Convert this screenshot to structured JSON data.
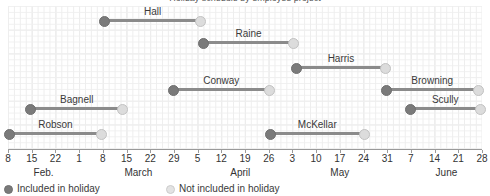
{
  "chart": {
    "title": "Holiday schedule by employee project",
    "title_clipped": true
  },
  "chart_data": {
    "type": "bar",
    "subtype": "gantt",
    "title": "Holiday schedule by employee project",
    "xlabel": "",
    "ylabel": "",
    "grid": true,
    "legend_position": "bottom-left",
    "x_unit": "week",
    "x_tick_labels": [
      "8",
      "15",
      "22",
      "1",
      "8",
      "15",
      "22",
      "29",
      "5",
      "12",
      "19",
      "26",
      "3",
      "10",
      "17",
      "24",
      "31",
      "7",
      "14",
      "21",
      "28"
    ],
    "x_tick_weeks": [
      0,
      1,
      2,
      3,
      4,
      5,
      6,
      7,
      8,
      9,
      10,
      11,
      12,
      13,
      14,
      15,
      16,
      17,
      18,
      19,
      20
    ],
    "month_labels": [
      {
        "label": "Feb.",
        "week": 1.5
      },
      {
        "label": "March",
        "week": 5.5
      },
      {
        "label": "April",
        "week": 9.8
      },
      {
        "label": "May",
        "week": 14.0
      },
      {
        "label": "June",
        "week": 18.5
      }
    ],
    "legend": [
      {
        "label": "Included in holiday",
        "marker": "filled-dot",
        "color": "#7a7a7a"
      },
      {
        "label": "Not included in holiday",
        "marker": "hollow-dot",
        "color": "#e3e3e3"
      }
    ],
    "series": [
      {
        "name": "Hall",
        "start_week": 4.0,
        "end_week": 8.2,
        "start_label": "8",
        "end_label": "5",
        "row": 0,
        "label_side": "center"
      },
      {
        "name": "Raine",
        "start_week": 8.2,
        "end_week": 12.1,
        "start_label": "5",
        "end_label": "3",
        "row": 1,
        "label_side": "center"
      },
      {
        "name": "Harris",
        "start_week": 12.1,
        "end_week": 16.0,
        "start_label": "3",
        "end_label": "31",
        "row": 2,
        "label_side": "center"
      },
      {
        "name": "Browning",
        "start_week": 15.9,
        "end_week": 19.9,
        "start_label": "31",
        "end_label": "21",
        "row": 3,
        "label_side": "center"
      },
      {
        "name": "Conway",
        "start_week": 6.9,
        "end_week": 11.1,
        "start_label": "29",
        "end_label": "26",
        "row": 3,
        "label_side": "center"
      },
      {
        "name": "Bagnell",
        "start_week": 0.9,
        "end_week": 4.9,
        "start_label": "15",
        "end_label": "15",
        "row": 4,
        "label_side": "center"
      },
      {
        "name": "Scully",
        "start_week": 16.9,
        "end_week": 20.0,
        "start_label": "7",
        "end_label": "28",
        "row": 4,
        "label_side": "center"
      },
      {
        "name": "Robson",
        "start_week": 0.0,
        "end_week": 4.0,
        "start_label": "8",
        "end_label": "8",
        "row": 5,
        "label_side": "center"
      },
      {
        "name": "McKellar",
        "start_week": 11.0,
        "end_week": 15.1,
        "start_label": "26",
        "end_label": "24",
        "row": 5,
        "label_side": "center"
      }
    ],
    "colors": {
      "bar": "#8b8b8b",
      "included_marker": "#7a7a7a",
      "excluded_marker": "#dcdcdc",
      "grid": "#e9e9e9",
      "axis": "#9a9a9a",
      "text": "#333333"
    }
  }
}
